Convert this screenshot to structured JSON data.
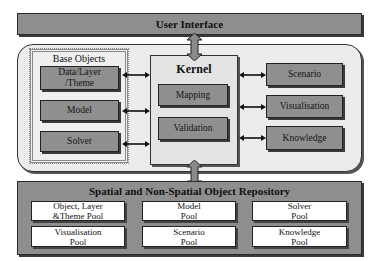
{
  "diagram": {
    "user_interface": {
      "label": "User Interface"
    },
    "base_objects": {
      "title": "Base Objects",
      "items": [
        {
          "label": "Data/Layer /Theme"
        },
        {
          "label": "Model"
        },
        {
          "label": "Solver"
        }
      ]
    },
    "kernel": {
      "title": "Kernel",
      "items": [
        {
          "label": "Mapping"
        },
        {
          "label": "Validation"
        }
      ]
    },
    "right_modules": [
      {
        "label": "Scenario"
      },
      {
        "label": "Visualisation"
      },
      {
        "label": "Knowledge"
      }
    ],
    "repository": {
      "title": "Spatial and Non-Spatial Object Repository",
      "pools": [
        {
          "label": "Object, Layer &Theme Pool"
        },
        {
          "label": "Model Pool"
        },
        {
          "label": "Solver Pool"
        },
        {
          "label": "Visualisation Pool"
        },
        {
          "label": "Scenario Pool"
        },
        {
          "label": "Knowledge Pool"
        }
      ]
    },
    "colors": {
      "box_fill": "#8f8f8f",
      "container_fill": "#ececec",
      "pool_fill": "#ffffff",
      "border": "#222222"
    }
  }
}
